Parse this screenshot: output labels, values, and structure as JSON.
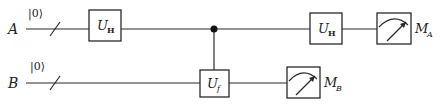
{
  "diagram": {
    "type": "quantum-circuit",
    "qubits": [
      {
        "label": "A",
        "initial_state": "|0⟩"
      },
      {
        "label": "B",
        "initial_state": "|0⟩"
      }
    ],
    "gates": [
      {
        "name": "U",
        "subscript": "H",
        "wire": "A",
        "order": 1
      },
      {
        "name": "U",
        "subscript": "f",
        "wire": "B",
        "control": "A",
        "order": 2
      },
      {
        "name": "U",
        "subscript": "H",
        "wire": "A",
        "order": 3
      }
    ],
    "measurements": [
      {
        "label": "M",
        "subscript": "A",
        "wire": "A"
      },
      {
        "label": "M",
        "subscript": "B",
        "wire": "B"
      }
    ],
    "colors": {
      "line": "#2a2a2a",
      "background": "#ffffff"
    }
  }
}
